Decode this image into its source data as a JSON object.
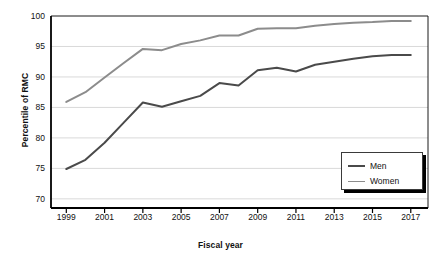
{
  "chart_data": {
    "type": "line",
    "title": "",
    "subtitle": "",
    "xlabel": "Fiscal year",
    "ylabel": "Percentile of RMC",
    "x": [
      1999,
      2000,
      2001,
      2002,
      2003,
      2004,
      2005,
      2006,
      2007,
      2008,
      2009,
      2010,
      2011,
      2012,
      2013,
      2014,
      2015,
      2016,
      2017
    ],
    "xtick_labels": [
      "1999",
      "2001",
      "2003",
      "2005",
      "2007",
      "2009",
      "2011",
      "2013",
      "2015",
      "2017"
    ],
    "xtick_values": [
      1999,
      2001,
      2003,
      2005,
      2007,
      2009,
      2011,
      2013,
      2015,
      2017
    ],
    "ytick_labels": [
      "70",
      "75",
      "80",
      "85",
      "90",
      "95",
      "100"
    ],
    "ytick_values": [
      70,
      75,
      80,
      85,
      90,
      95,
      100
    ],
    "xlim": [
      1998.2,
      2017.9
    ],
    "ylim": [
      68.5,
      100
    ],
    "grid": "horizontal",
    "legend_position": "bottom-right",
    "series": [
      {
        "name": "Men",
        "color": "#4a4a4a",
        "width": 2.0,
        "values": [
          74.9,
          76.4,
          79.2,
          82.5,
          85.8,
          85.1,
          86.0,
          86.9,
          89.0,
          88.6,
          91.1,
          91.5,
          90.9,
          92.0,
          92.5,
          93.0,
          93.4,
          93.6,
          93.6
        ]
      },
      {
        "name": "Women",
        "color": "#8c8c8c",
        "width": 2.0,
        "values": [
          85.9,
          87.5,
          89.9,
          92.3,
          94.6,
          94.4,
          95.4,
          96.0,
          96.8,
          96.8,
          97.9,
          98.0,
          98.0,
          98.4,
          98.7,
          98.9,
          99.0,
          99.2,
          99.2
        ]
      }
    ]
  },
  "axes": {
    "frame_color": "#000000",
    "grid_color": "#d9d9d9"
  },
  "legend": {
    "items": [
      {
        "label": "Men",
        "color": "#4a4a4a"
      },
      {
        "label": "Women",
        "color": "#8c8c8c"
      }
    ]
  }
}
